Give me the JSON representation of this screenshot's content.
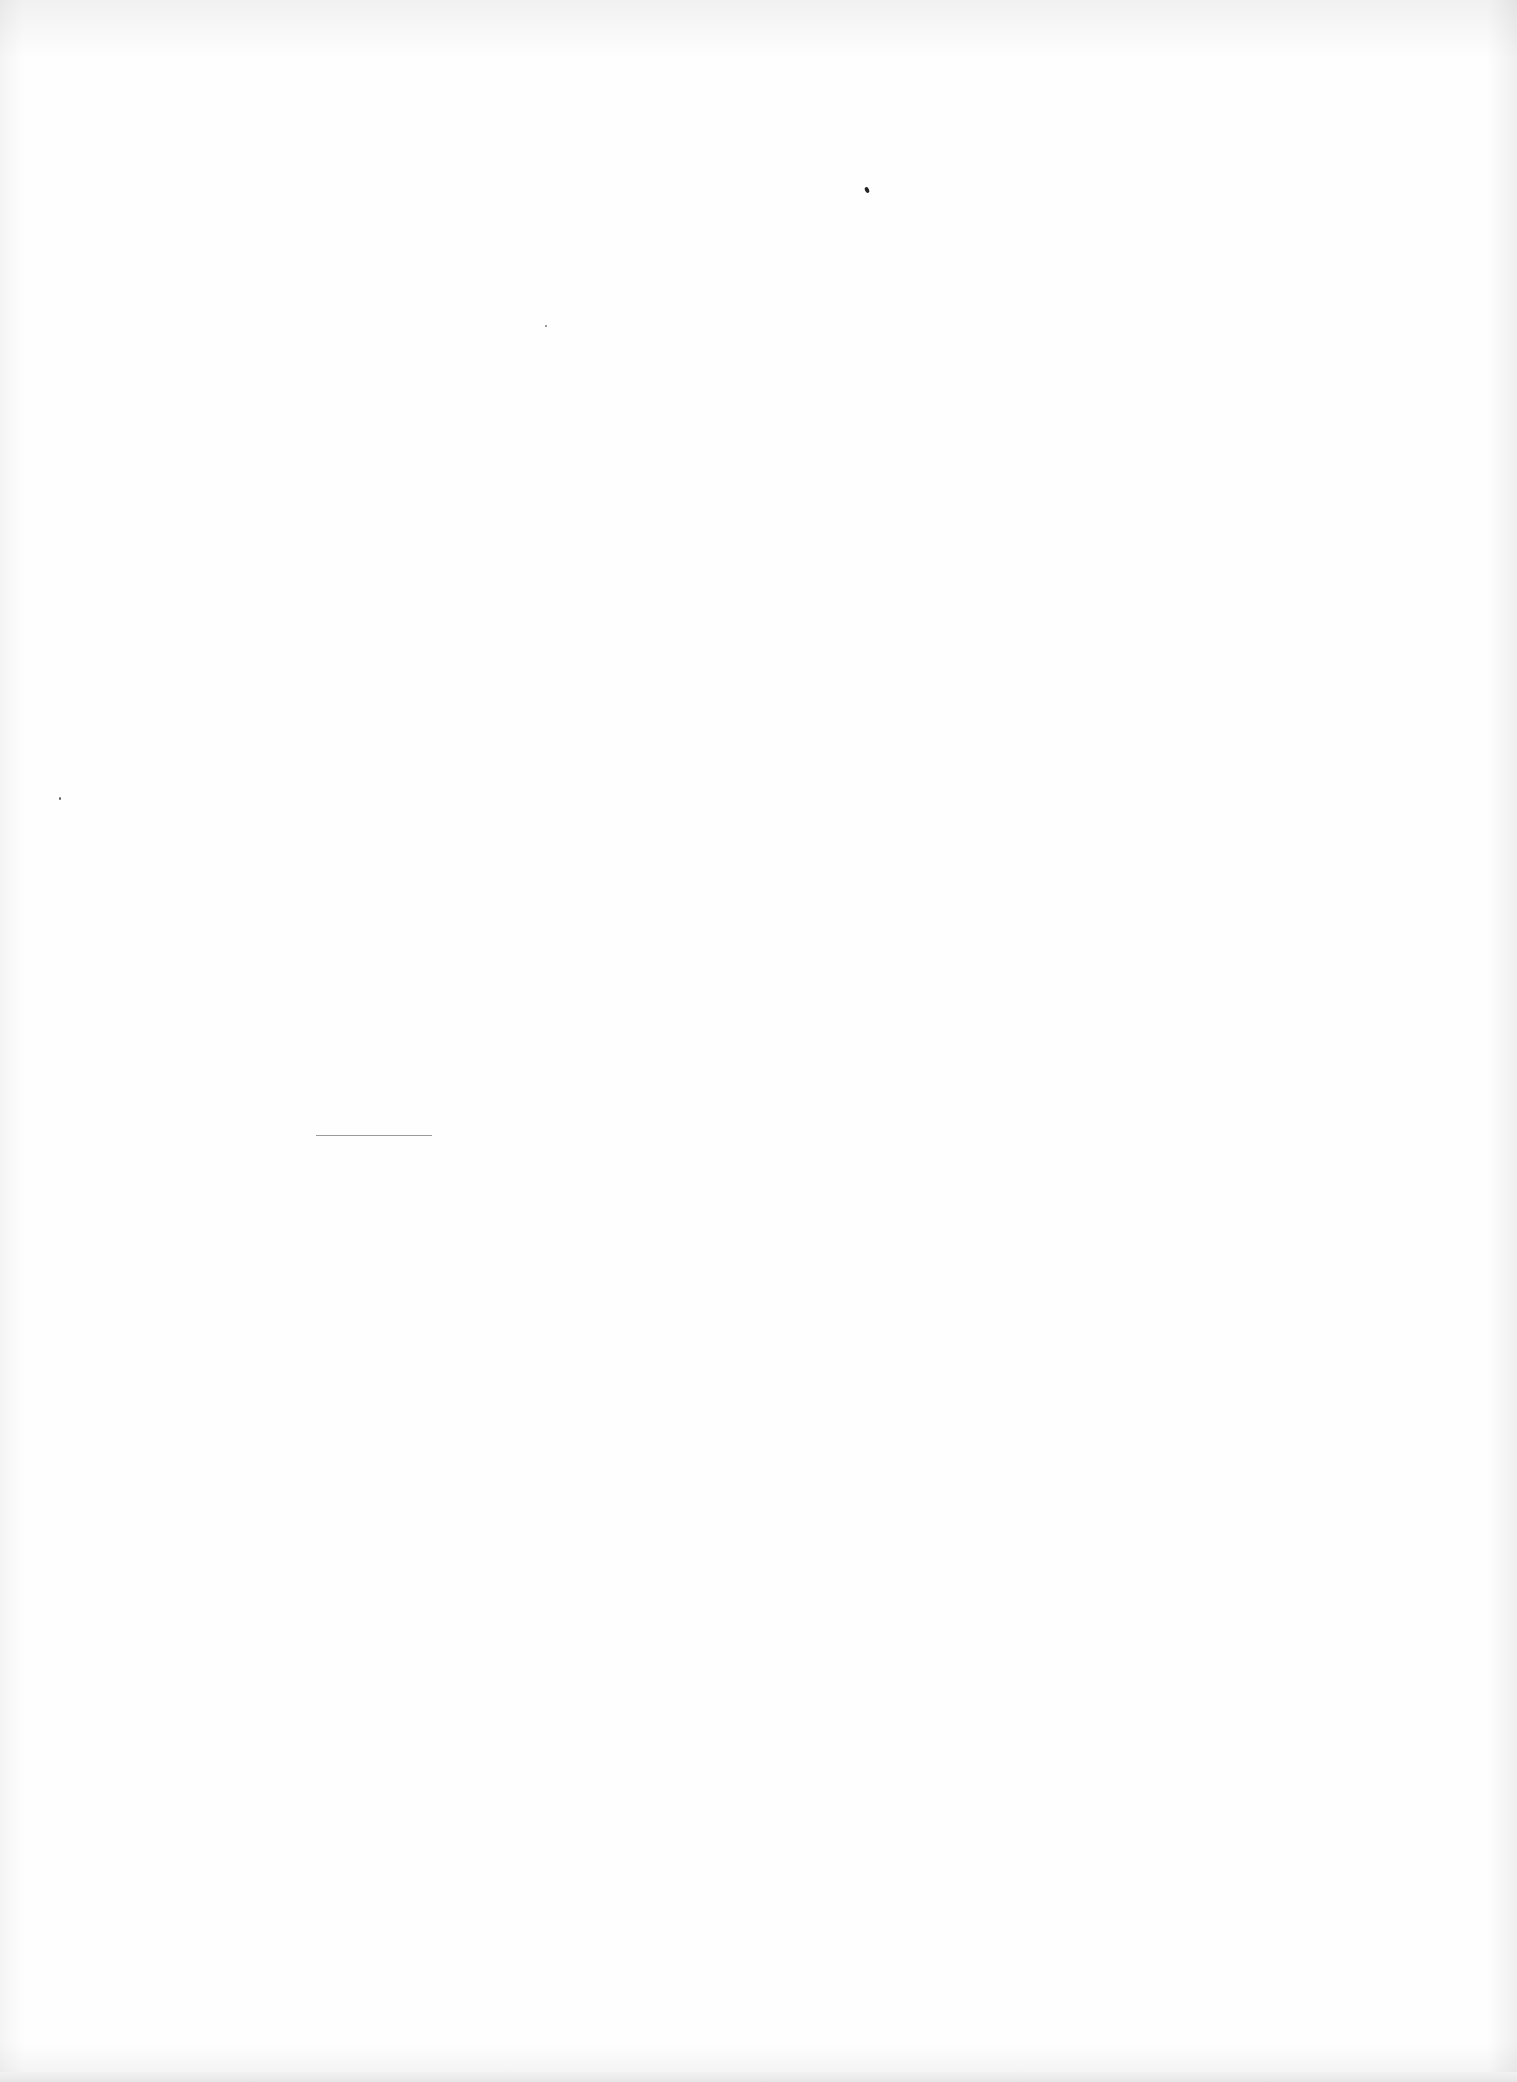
{
  "document": {
    "type": "blank scanned page",
    "text": "",
    "marks": [
      {
        "kind": "speck",
        "x": 866,
        "y": 189,
        "w": 4,
        "h": 6
      },
      {
        "kind": "rule",
        "x": 316,
        "y": 1135,
        "w": 116
      }
    ]
  }
}
